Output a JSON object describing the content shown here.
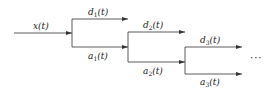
{
  "diagram": {
    "input": {
      "symbol": "x",
      "arg": "(t)"
    },
    "levels": [
      {
        "detail": {
          "symbol": "d",
          "sub": "1",
          "arg": "(t)"
        },
        "approx": {
          "symbol": "a",
          "sub": "1",
          "arg": "(t)"
        }
      },
      {
        "detail": {
          "symbol": "d",
          "sub": "2",
          "arg": "(t)"
        },
        "approx": {
          "symbol": "a",
          "sub": "2",
          "arg": "(t)"
        }
      },
      {
        "detail": {
          "symbol": "d",
          "sub": "3",
          "arg": "(t)"
        },
        "approx": {
          "symbol": "a",
          "sub": "3",
          "arg": "(t)"
        }
      }
    ],
    "continuation": "···",
    "line_color": "#333333"
  }
}
